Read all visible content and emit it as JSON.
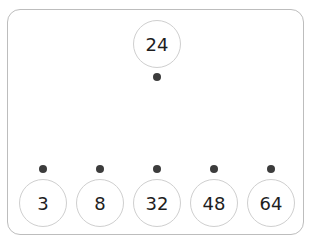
{
  "diagram": {
    "top_node": {
      "value": "24"
    },
    "bottom_nodes": [
      {
        "value": "3"
      },
      {
        "value": "8"
      },
      {
        "value": "32"
      },
      {
        "value": "48"
      },
      {
        "value": "64"
      }
    ],
    "colors": {
      "frame_border": "#bdbdbd",
      "node_border": "#cfcfcf",
      "dot": "#3c3c3c",
      "text": "#1e1e1e"
    }
  }
}
